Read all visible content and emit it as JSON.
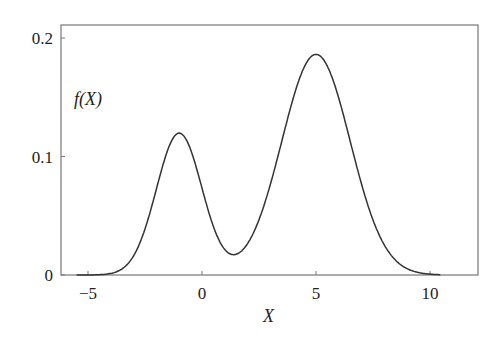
{
  "chart_data": {
    "type": "line",
    "title": "",
    "xlabel": "X",
    "ylabel": "f(X)",
    "xlim": [
      -6.2,
      12.1
    ],
    "ylim": [
      0,
      0.211
    ],
    "grid": false,
    "legend": null,
    "x_ticks": [
      -5,
      0,
      5,
      10
    ],
    "x_tick_labels": [
      "−5",
      "0",
      "5",
      "10"
    ],
    "y_ticks": [
      0,
      0.1,
      0.2
    ],
    "y_tick_labels": [
      "0",
      "0.1",
      "0.2"
    ],
    "series": [
      {
        "name": "f(X)",
        "description": "bimodal density: 0.3*N(-1,1) + 0.7*N(5,1.5)",
        "x": [
          -6,
          -5,
          -4.5,
          -4,
          -3.5,
          -3,
          -2.5,
          -2,
          -1.5,
          -1,
          -0.5,
          0,
          0.5,
          1,
          1.5,
          1.7,
          2,
          2.5,
          3,
          3.5,
          4,
          4.5,
          5,
          5.5,
          6,
          6.5,
          7,
          7.5,
          8,
          8.5,
          9,
          9.5,
          10,
          11,
          12
        ],
        "values": [
          0.0,
          0.0001,
          0.0003,
          0.0013,
          0.004,
          0.0163,
          0.039,
          0.0726,
          0.1056,
          0.1197,
          0.106,
          0.0729,
          0.0398,
          0.0189,
          0.0189,
          0.0214,
          0.028,
          0.0472,
          0.0728,
          0.1012,
          0.1427,
          0.175,
          0.1862,
          0.175,
          0.1582,
          0.126,
          0.0915,
          0.061,
          0.0384,
          0.0205,
          0.0107,
          0.0048,
          0.002,
          0.0003,
          0.0
        ]
      }
    ]
  },
  "labels": {
    "ylabel": "f(X)",
    "xlabel": "X"
  }
}
